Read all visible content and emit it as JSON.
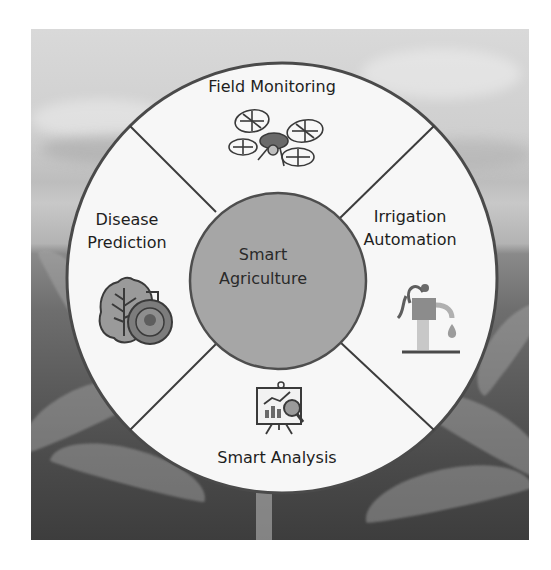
{
  "diagram": {
    "center": {
      "title": "Smart Agriculture",
      "line1": "Smart",
      "line2": "Agriculture"
    },
    "segments": [
      {
        "position": "top",
        "label": "Field Monitoring",
        "line1": "Field Monitoring",
        "icon": "drone-icon"
      },
      {
        "position": "right",
        "label": "Irrigation Automation",
        "line1": "Irrigation",
        "line2": "Automation",
        "icon": "water-pump-icon"
      },
      {
        "position": "bottom",
        "label": "Smart Analysis",
        "line1": "Smart Analysis",
        "icon": "analytics-board-icon"
      },
      {
        "position": "left",
        "label": "Disease Prediction",
        "line1": "Disease",
        "line2": "Prediction",
        "icon": "leaf-virus-icon"
      }
    ],
    "background": "corn-field-photo",
    "colors": {
      "ring_fill": "#f7f7f7",
      "ring_stroke": "#4a4a4a",
      "center_fill": "#a6a6a6",
      "divider": "#3c3c3c",
      "text": "#1e1e1e"
    }
  }
}
